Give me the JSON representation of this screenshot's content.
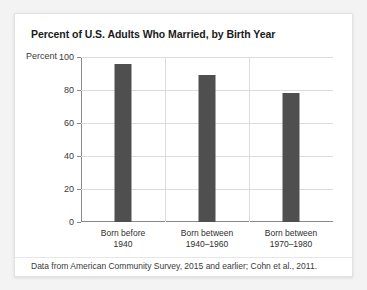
{
  "card": {
    "title": "Percent of U.S. Adults Who Married, by Birth Year",
    "axis_unit_label": "Percent",
    "footnote": "Data from American Community Survey, 2015 and earlier; Cohn et al., 2011."
  },
  "colors": {
    "bar": "#4f4f4f",
    "gridline": "#dcdcdc",
    "axis": "#8a8a8a",
    "card_background": "#ffffff",
    "page_background": "#f3f3f3",
    "title_text": "#1a1a1a",
    "body_text": "#3a3a3a"
  },
  "chart_data": {
    "type": "bar",
    "title": "Percent of U.S. Adults Who Married, by Birth Year",
    "xlabel": "",
    "ylabel": "Percent",
    "ylim": [
      0,
      100
    ],
    "yticks": [
      0,
      20,
      40,
      60,
      80,
      100
    ],
    "ytick_labels": [
      "0",
      "20",
      "40",
      "60",
      "80",
      "100"
    ],
    "grid": true,
    "legend": false,
    "categories": [
      "Born before 1940",
      "Born between 1940–1960",
      "Born between 1970–1980"
    ],
    "category_lines": [
      [
        "Born before",
        "1940"
      ],
      [
        "Born between",
        "1940–1960"
      ],
      [
        "Born between",
        "1970–1980"
      ]
    ],
    "values": [
      96,
      89,
      78
    ],
    "bar_color": "#4f4f4f",
    "annotation": "Data from American Community Survey, 2015 and earlier; Cohn et al., 2011."
  }
}
